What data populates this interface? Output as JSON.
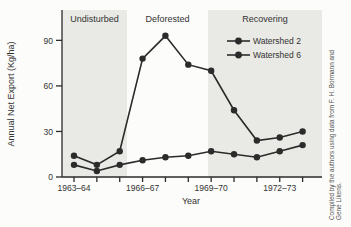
{
  "caption": {
    "line1": "Compiled by the authors using data from F. H. Bormann and",
    "line2": "Gene Likens."
  },
  "chart_data": {
    "type": "line",
    "title": "",
    "xlabel": "Year",
    "ylabel": "Annual Net Export (Kg/ha)",
    "x_labels": [
      "1963–64",
      "1964–65",
      "1965–66",
      "1966–67",
      "1967–68",
      "1968–69",
      "1969–70",
      "1970–71",
      "1971–72",
      "1972–73",
      "1973–74"
    ],
    "x_tick_label_indices": [
      0,
      3,
      6,
      9
    ],
    "yticks": [
      0,
      30,
      60,
      90
    ],
    "ylim": [
      0,
      110
    ],
    "grid": false,
    "legend_position": "upper right",
    "marker": "circle",
    "line_color": "#2b2b2b",
    "band_color": "#e9e9e5",
    "regions": [
      {
        "label": "Undisturbed",
        "start_index": 0,
        "end_index": 2,
        "shaded": true
      },
      {
        "label": "Deforested",
        "start_index": 3,
        "end_index": 5,
        "shaded": false
      },
      {
        "label": "Recovering",
        "start_index": 6,
        "end_index": 10,
        "shaded": true
      }
    ],
    "series": [
      {
        "name": "Watershed 2",
        "values": [
          14,
          8,
          17,
          78,
          93,
          74,
          70,
          44,
          24,
          26,
          30
        ]
      },
      {
        "name": "Watershed 6",
        "values": [
          8,
          4,
          8,
          11,
          13,
          14,
          17,
          15,
          13,
          17,
          21
        ]
      }
    ]
  }
}
